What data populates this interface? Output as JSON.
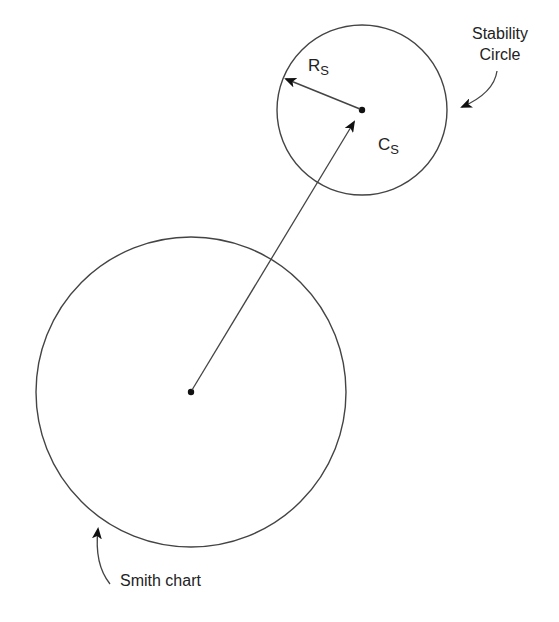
{
  "diagram": {
    "colors": {
      "stroke": "#444444",
      "arrow": "#111111",
      "text": "#222222",
      "background": "#ffffff"
    },
    "smith_chart": {
      "label": "Smith chart",
      "center": [
        191,
        392
      ],
      "radius": 155
    },
    "stability_circle": {
      "label_line1": "Stability",
      "label_line2": "Circle",
      "center": [
        362,
        110
      ],
      "radius": 85
    },
    "radius_label": {
      "main": "R",
      "sub": "S"
    },
    "center_label": {
      "main": "C",
      "sub": "S"
    }
  }
}
